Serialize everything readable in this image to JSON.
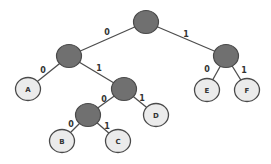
{
  "diagram": {
    "type": "binary-tree",
    "colors": {
      "internal_fill": "#707070",
      "leaf_fill": "#ebebeb",
      "outline": "#4a4a4a",
      "edge": "#4d4d4d",
      "background": "#ffffff"
    },
    "nodes": [
      {
        "id": "root",
        "kind": "internal",
        "label": ""
      },
      {
        "id": "n0",
        "kind": "internal",
        "label": ""
      },
      {
        "id": "n1",
        "kind": "internal",
        "label": ""
      },
      {
        "id": "A",
        "kind": "leaf",
        "label": "A"
      },
      {
        "id": "n01",
        "kind": "internal",
        "label": ""
      },
      {
        "id": "E",
        "kind": "leaf",
        "label": "E"
      },
      {
        "id": "F",
        "kind": "leaf",
        "label": "F"
      },
      {
        "id": "n010",
        "kind": "internal",
        "label": ""
      },
      {
        "id": "D",
        "kind": "leaf",
        "label": "D"
      },
      {
        "id": "B",
        "kind": "leaf",
        "label": "B"
      },
      {
        "id": "C",
        "kind": "leaf",
        "label": "C"
      }
    ],
    "edges": [
      {
        "from": "root",
        "to": "n0",
        "label": "0"
      },
      {
        "from": "root",
        "to": "n1",
        "label": "1"
      },
      {
        "from": "n0",
        "to": "A",
        "label": "0"
      },
      {
        "from": "n0",
        "to": "n01",
        "label": "1"
      },
      {
        "from": "n1",
        "to": "E",
        "label": "0"
      },
      {
        "from": "n1",
        "to": "F",
        "label": "1"
      },
      {
        "from": "n01",
        "to": "n010",
        "label": "0"
      },
      {
        "from": "n01",
        "to": "D",
        "label": "1"
      },
      {
        "from": "n010",
        "to": "B",
        "label": "0"
      },
      {
        "from": "n010",
        "to": "C",
        "label": "1"
      }
    ]
  }
}
